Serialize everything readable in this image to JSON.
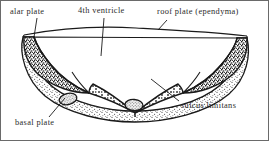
{
  "figure": {
    "border_color": "#6a6a6a",
    "ink_color": "#1a1a1a",
    "background_color": "#ffffff"
  },
  "labels": {
    "alar_plate": "alar plate",
    "fourth_ventricle": "4th ventricle",
    "roof_plate": "roof plate (ependyma)",
    "basal_plate": "basal plate",
    "sulcus_limitans": "sulcus limitans"
  },
  "structures": {
    "roof_plate": "thin ependymal membrane spanning the open top of the ventricle",
    "alar_plate": "paired dense cross-hatched (stippled dark) wedges on the upper lateral walls",
    "basal_plate": "paired stippled regions in the floor, each containing a small oval nucleus",
    "sulcus_limitans": "groove on the inner wall separating alar from basal plate",
    "nuclei": 2,
    "alar_plates": 2,
    "basal_plates": 2
  }
}
